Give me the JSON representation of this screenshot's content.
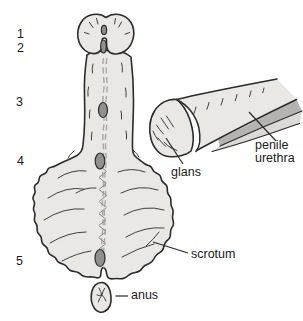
{
  "diagram": {
    "title_semantic": "development of male external genitalia",
    "stages": [
      {
        "label": "1"
      },
      {
        "label": "2"
      },
      {
        "label": "3"
      },
      {
        "label": "4"
      },
      {
        "label": "5"
      }
    ],
    "labels": {
      "glans": "glans",
      "penile_urethra": "penile urethra",
      "scrotum": "scrotum",
      "anus": "anus"
    },
    "colors": {
      "background": "#ffffff",
      "body_fill": "#e9e8e4",
      "outline": "#2b2b2b",
      "opening_fill": "#90908d",
      "raphe": "#a9a7a3",
      "urethra_band_dark": "#b4b3af",
      "urethra_band_light": "#dbdad6",
      "label_text": "#1a1a1a"
    }
  }
}
